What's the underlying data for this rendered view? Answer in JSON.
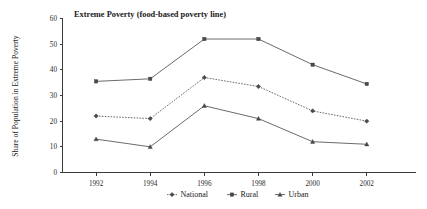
{
  "chart_data": {
    "type": "line",
    "title": "Extreme Poverty (food-based poverty line)",
    "xlabel": "",
    "ylabel": "Share of Population in Extreme Poverty",
    "categories": [
      "1992",
      "1994",
      "1996",
      "1998",
      "2000",
      "2002"
    ],
    "x": [
      1992,
      1994,
      1996,
      1998,
      2000,
      2002
    ],
    "ylim": [
      0,
      60
    ],
    "yticks": [
      "0",
      "10",
      "20",
      "30",
      "40",
      "50",
      "60"
    ],
    "ytick_values": [
      0,
      10,
      20,
      30,
      40,
      50,
      60
    ],
    "grid": false,
    "legend_position": "bottom",
    "series": [
      {
        "name": "National",
        "style": "dashed",
        "marker": "diamond",
        "values": [
          22.0,
          21.0,
          37.0,
          33.5,
          24.0,
          20.0
        ]
      },
      {
        "name": "Rural",
        "style": "solid",
        "marker": "square",
        "values": [
          35.5,
          36.5,
          52.0,
          52.0,
          42.0,
          34.5
        ]
      },
      {
        "name": "Urban",
        "style": "solid",
        "marker": "triangle",
        "values": [
          13.0,
          10.0,
          26.0,
          21.0,
          12.0,
          11.0
        ]
      }
    ]
  },
  "legend": {
    "items": [
      {
        "label": "National"
      },
      {
        "label": "Rural"
      },
      {
        "label": "Urban"
      }
    ]
  },
  "colors": {
    "line": "#5a5a5a",
    "axis": "#3a3a3a",
    "text": "#1a1a1a",
    "background": "#ffffff"
  }
}
